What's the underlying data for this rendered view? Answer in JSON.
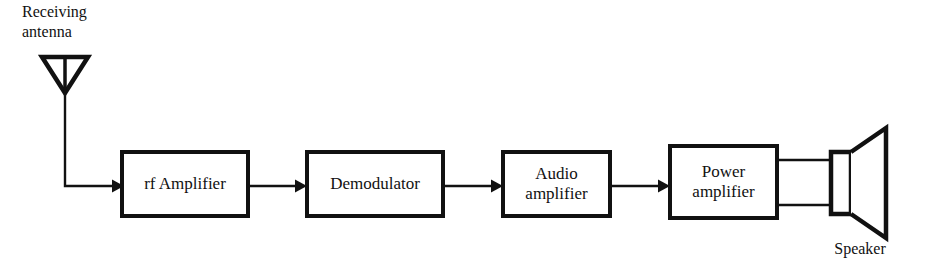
{
  "diagram": {
    "stroke_color": "#111111",
    "fill_color": "#ffffff",
    "background_color": "#ffffff",
    "labels": {
      "antenna": "Receiving\nantenna",
      "speaker": "Speaker"
    },
    "blocks": [
      {
        "id": "rf-amplifier",
        "label": "rf Amplifier"
      },
      {
        "id": "demodulator",
        "label": "Demodulator"
      },
      {
        "id": "audio-amplifier",
        "label": "Audio\namplifier"
      },
      {
        "id": "power-amplifier",
        "label": "Power\namplifier"
      }
    ],
    "signal_flow": [
      "Receiving antenna",
      "rf Amplifier",
      "Demodulator",
      "Audio amplifier",
      "Power amplifier",
      "Speaker"
    ],
    "symbols": {
      "antenna": "antenna-triangle-icon",
      "speaker": "loudspeaker-icon",
      "connector": "arrow-right-icon"
    }
  }
}
